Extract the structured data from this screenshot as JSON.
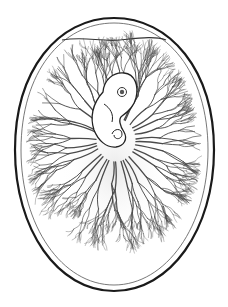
{
  "illustration": {
    "subject": "chick embryo inside egg with branching blood vessels",
    "elements": [
      "egg-shell",
      "shell-membrane",
      "air-cell",
      "embryo",
      "embryo-eye",
      "blood-vessel-network"
    ],
    "colors": {
      "background": "#ffffff",
      "shell_outline": "#1a1a1a",
      "membrane_outline": "#555555",
      "vessels": "#4a4a4a",
      "embryo_fill": "#ffffff",
      "embryo_outline": "#222222"
    },
    "vessel_branch_count": 34
  }
}
